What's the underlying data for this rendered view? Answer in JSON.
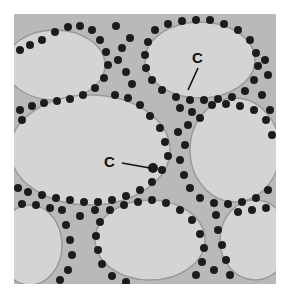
{
  "figure": {
    "background_color": "#c9c9c9",
    "colloid_color": "#d3d3d3",
    "nucleus_color": "#1e1e1e",
    "labels": [
      {
        "text": "C",
        "x": 196,
        "y": 50,
        "pointer_to": [
          188,
          90
        ]
      },
      {
        "text": "C",
        "x": 104,
        "y": 156,
        "pointer_to": [
          153,
          168
        ]
      }
    ]
  }
}
